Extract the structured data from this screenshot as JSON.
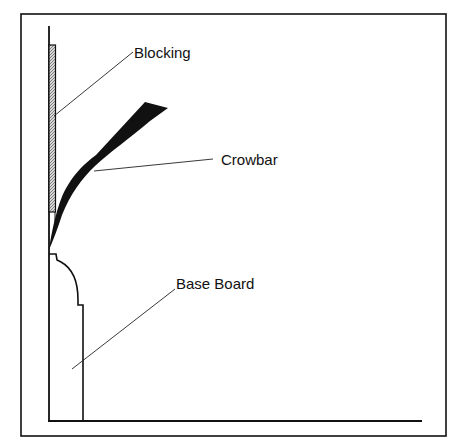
{
  "diagram": {
    "labels": {
      "blocking": "Blocking",
      "crowbar": "Crowbar",
      "base_board": "Base Board"
    },
    "colors": {
      "line": "#111111",
      "background": "#ffffff",
      "hatch": "#9a9a9a"
    }
  }
}
